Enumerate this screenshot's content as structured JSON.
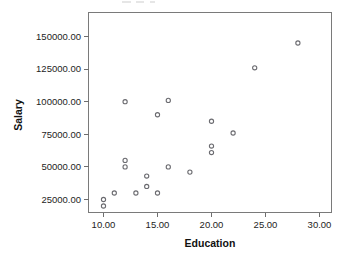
{
  "chart_data": {
    "type": "scatter",
    "title": "",
    "xlabel": "Education",
    "ylabel": "Salary",
    "xlim": [
      8.6,
      31.0
    ],
    "ylim": [
      12000,
      158000
    ],
    "grid": false,
    "legend": "none",
    "x_ticks": [
      10,
      15,
      20,
      25,
      30
    ],
    "x_tick_labels": [
      "10.00",
      "15.00",
      "20.00",
      "25.00",
      "30.00"
    ],
    "y_ticks": [
      25000,
      50000,
      75000,
      100000,
      125000,
      150000
    ],
    "y_tick_labels": [
      "25000.00",
      "50000.00",
      "75000.00",
      "100000.00",
      "125000.00",
      "150000.00"
    ],
    "marker": "open-circle",
    "marker_color": "#6b6b70",
    "points": [
      {
        "x": 10.0,
        "y": 25000
      },
      {
        "x": 10.0,
        "y": 20000
      },
      {
        "x": 11.0,
        "y": 30000
      },
      {
        "x": 12.0,
        "y": 100000
      },
      {
        "x": 12.0,
        "y": 55000
      },
      {
        "x": 12.0,
        "y": 50000
      },
      {
        "x": 13.0,
        "y": 30000
      },
      {
        "x": 14.0,
        "y": 43000
      },
      {
        "x": 14.0,
        "y": 35000
      },
      {
        "x": 15.0,
        "y": 90000
      },
      {
        "x": 15.0,
        "y": 30000
      },
      {
        "x": 16.0,
        "y": 101000
      },
      {
        "x": 16.0,
        "y": 50000
      },
      {
        "x": 18.0,
        "y": 46000
      },
      {
        "x": 20.0,
        "y": 85000
      },
      {
        "x": 20.0,
        "y": 66000
      },
      {
        "x": 20.0,
        "y": 61000
      },
      {
        "x": 22.0,
        "y": 76000
      },
      {
        "x": 24.0,
        "y": 126000
      },
      {
        "x": 28.0,
        "y": 145000
      }
    ]
  },
  "axes": {
    "y_title": "Salary",
    "x_title": "Education"
  },
  "colors": {
    "frame": "#7a7a7a",
    "marker": "#6b6b70",
    "text": "#1d1d1d",
    "background": "#ffffff"
  }
}
